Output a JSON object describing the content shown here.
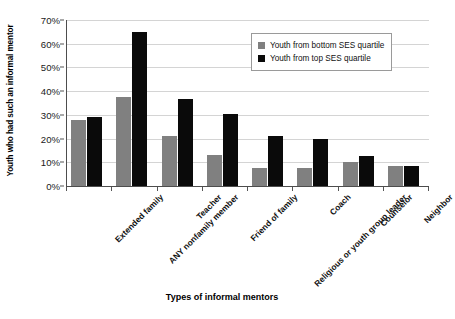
{
  "chart_data": {
    "type": "bar",
    "title": "",
    "xlabel": "Types of informal mentors",
    "ylabel": "Youth who had such an informal mentor",
    "categories": [
      "Extended family",
      "ANY nonfamily member",
      "Teacher",
      "Friend of family",
      "Religious or youth group leader",
      "Coach",
      "Counselor",
      "Neighbor"
    ],
    "series": [
      {
        "name": "Youth from bottom SES quartile",
        "color": "#808080",
        "values": [
          28,
          37.5,
          21,
          13,
          7.5,
          7.5,
          10,
          8.5
        ]
      },
      {
        "name": "Youth from top SES quartile",
        "color": "#0a0a0a",
        "values": [
          29,
          65,
          36.5,
          30.5,
          21,
          20,
          12.5,
          8.5
        ]
      }
    ],
    "ylim": [
      0,
      70
    ],
    "ytick_values": [
      0,
      10,
      20,
      30,
      40,
      50,
      60,
      70
    ],
    "ytick_labels": [
      "0%",
      "10%",
      "20%",
      "30%",
      "40%",
      "50%",
      "60%",
      "70%"
    ],
    "grid": true,
    "legend_position": "top-right"
  },
  "legend": {
    "entries": [
      {
        "label": "Youth from bottom SES quartile",
        "swatch": "#808080"
      },
      {
        "label": "Youth from top SES quartile",
        "swatch": "#0a0a0a"
      }
    ]
  }
}
